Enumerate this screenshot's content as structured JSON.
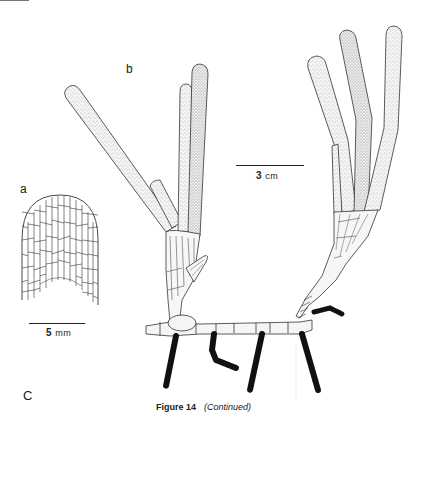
{
  "figure": {
    "caption_label": "Figure 14",
    "caption_note": "(Continued)"
  },
  "panels": {
    "a": {
      "label": "a",
      "scale_value": "5",
      "scale_unit": "mm",
      "description": "Cellular apex of leaf tip showing net-like cell pattern"
    },
    "b": {
      "label": "b",
      "scale_value": "3",
      "scale_unit": "cm",
      "description": "Two shoots with strap-shaped stippled leaves on a jointed rhizome with hairy roots"
    },
    "c": {
      "label": "C"
    }
  }
}
